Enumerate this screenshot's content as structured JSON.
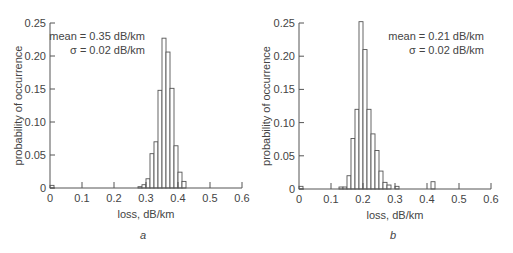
{
  "chart_data": [
    {
      "type": "bar",
      "panel_label": "a",
      "title": "",
      "xlabel": "loss, dB/km",
      "ylabel": "probability of occurrence",
      "xlim": [
        0,
        0.6
      ],
      "ylim": [
        0,
        0.25
      ],
      "xticks": [
        "0",
        "0.1",
        "0.2",
        "0.3",
        "0.4",
        "0.5",
        "0.6"
      ],
      "xtick_values": [
        0,
        0.1,
        0.2,
        0.3,
        0.4,
        0.5,
        0.6
      ],
      "yticks": [
        "0",
        "0.05",
        "0.10",
        "0.15",
        "0.20",
        "0.25"
      ],
      "ytick_values": [
        0,
        0.05,
        0.1,
        0.15,
        0.2,
        0.25
      ],
      "annotations": [
        "mean = 0.35 dB/km",
        "σ = 0.02 dB/km"
      ],
      "bin_width": 0.0125,
      "bins": [
        {
          "x": 0.0,
          "value": 0.004
        },
        {
          "x": 0.275,
          "value": 0.002
        },
        {
          "x": 0.2875,
          "value": 0.005
        },
        {
          "x": 0.3,
          "value": 0.014
        },
        {
          "x": 0.3125,
          "value": 0.052
        },
        {
          "x": 0.325,
          "value": 0.07
        },
        {
          "x": 0.3375,
          "value": 0.148
        },
        {
          "x": 0.35,
          "value": 0.227
        },
        {
          "x": 0.3625,
          "value": 0.206
        },
        {
          "x": 0.375,
          "value": 0.151
        },
        {
          "x": 0.3875,
          "value": 0.064
        },
        {
          "x": 0.4,
          "value": 0.024
        },
        {
          "x": 0.4125,
          "value": 0.01
        }
      ]
    },
    {
      "type": "bar",
      "panel_label": "b",
      "title": "",
      "xlabel": "loss, dB/km",
      "ylabel": "probability of occurrence",
      "xlim": [
        0,
        0.6
      ],
      "ylim": [
        0,
        0.25
      ],
      "xticks": [
        "0",
        "0.1",
        "0.2",
        "0.3",
        "0.4",
        "0.5",
        "0.6"
      ],
      "xtick_values": [
        0,
        0.1,
        0.2,
        0.3,
        0.4,
        0.5,
        0.6
      ],
      "yticks": [
        "0",
        "0.05",
        "0.10",
        "0.15",
        "0.20",
        "0.25"
      ],
      "ytick_values": [
        0,
        0.05,
        0.1,
        0.15,
        0.2,
        0.25
      ],
      "annotations": [
        "mean = 0.21 dB/km",
        "σ = 0.02 dB/km"
      ],
      "bin_width": 0.0125,
      "bins": [
        {
          "x": 0.0,
          "value": 0.004
        },
        {
          "x": 0.125,
          "value": 0.003
        },
        {
          "x": 0.1375,
          "value": 0.003
        },
        {
          "x": 0.15,
          "value": 0.02
        },
        {
          "x": 0.1625,
          "value": 0.076
        },
        {
          "x": 0.175,
          "value": 0.12
        },
        {
          "x": 0.1875,
          "value": 0.252
        },
        {
          "x": 0.2,
          "value": 0.21
        },
        {
          "x": 0.2125,
          "value": 0.12
        },
        {
          "x": 0.225,
          "value": 0.083
        },
        {
          "x": 0.2375,
          "value": 0.058
        },
        {
          "x": 0.25,
          "value": 0.027
        },
        {
          "x": 0.2625,
          "value": 0.01
        },
        {
          "x": 0.275,
          "value": 0.006
        },
        {
          "x": 0.3,
          "value": 0.004
        },
        {
          "x": 0.4125,
          "value": 0.011
        }
      ]
    }
  ]
}
